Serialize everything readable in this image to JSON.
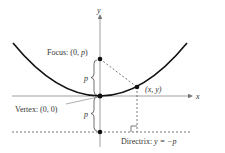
{
  "diagram": {
    "type": "parabola-definition",
    "axes": {
      "x_label": "x",
      "y_label": "y"
    },
    "labels": {
      "focus_prefix": "Focus: (0, ",
      "focus_var": "p",
      "focus_suffix": ")",
      "vertex": "Vertex: (0, 0)",
      "point": "(x, y)",
      "directrix_prefix": "Directrix: ",
      "directrix_eq": "y = −p",
      "p_upper": "p",
      "p_lower": "p"
    },
    "colors": {
      "curve": "#111111",
      "axis": "#777777",
      "dashed": "#555555",
      "text": "#333333"
    }
  }
}
